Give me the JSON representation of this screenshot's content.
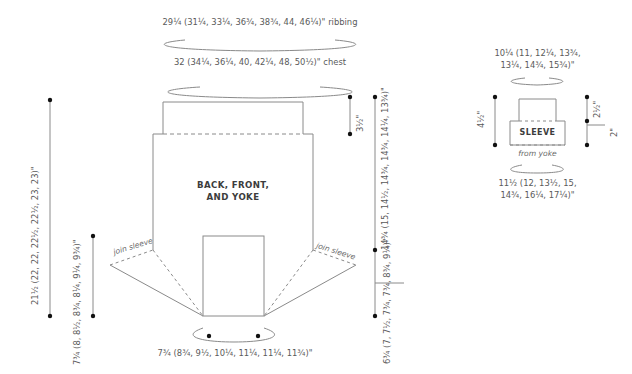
{
  "colors": {
    "line": "#8a8a8a",
    "text": "#5a5a5a",
    "label": "#3c3c3c",
    "dot": "#111111"
  },
  "body": {
    "ribbing": "29¼ (31¼, 33¼, 36¾, 38¾, 44, 46¼)\" ribbing",
    "chest": "32 (34¼, 36¼, 40, 42¼, 48, 50½)\" chest",
    "label_line1": "BACK, FRONT,",
    "label_line2": "AND YOKE",
    "yoke_top_depth": "3½\"",
    "body_length": "14¾ (15, 14½, 14¾, 14¾, 14¼, 13¾)\"",
    "yoke_depth": "6¾ (7, 7½, 7¾, 7¾, 8¾, 9¼)\"",
    "total_length": "21½ (22, 22, 22½, 22½, 23, 23)\"",
    "armhole": "7¾ (8, 8½, 8¾, 8¼, 9¼, 9¾)\"",
    "neck": "7¾ (8¾, 9½, 10¼, 11¼, 11¼, 11¾)\"",
    "join_sleeve_left": "join sleeve",
    "join_sleeve_right": "join sleeve"
  },
  "sleeve": {
    "cuff_line1": "10¼ (11, 12¼, 13¾,",
    "cuff_line2": "13¼, 14¾, 15¾)\"",
    "label": "SLEEVE",
    "from_yoke": "from yoke",
    "length": "4½\"",
    "cuff_depth": "2½\"",
    "upper": "2\"",
    "upper_arm_line1": "11½ (12, 13½, 15,",
    "upper_arm_line2": "14¾, 16¼, 17¼)\""
  }
}
